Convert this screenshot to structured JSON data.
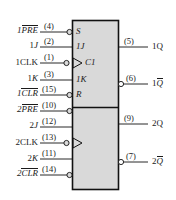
{
  "diagram": {
    "box": {
      "fill": "#d9d9d9",
      "stroke": "#111111",
      "x": 72,
      "y": 20,
      "width": 47,
      "height": 170,
      "divider_y": 107
    },
    "sections": [
      {
        "name": "ff1",
        "inner_labels": [
          "S",
          "1J",
          "C1",
          "1K",
          "R"
        ]
      },
      {
        "name": "ff2",
        "inner_labels": []
      }
    ],
    "inputs": [
      {
        "name": "1PRE",
        "text_plain": "1",
        "text_over": "PRE",
        "pin": "(4)",
        "y": 32,
        "bubble": true,
        "clock": false
      },
      {
        "name": "1J",
        "text_plain": "1",
        "text_over": "",
        "pin": "(2)",
        "y": 47,
        "bubble": false,
        "clock": false,
        "italic_tail": "J"
      },
      {
        "name": "1CLK",
        "text_plain": "1CLK",
        "text_over": "",
        "pin": "(1)",
        "y": 63,
        "bubble": true,
        "clock": true
      },
      {
        "name": "1K",
        "text_plain": "1",
        "text_over": "",
        "pin": "(3)",
        "y": 80,
        "bubble": false,
        "clock": false,
        "italic_tail": "K"
      },
      {
        "name": "1CLR",
        "text_plain": "1",
        "text_over": "CLR",
        "pin": "(15)",
        "y": 95,
        "bubble": true,
        "clock": false
      },
      {
        "name": "2PRE",
        "text_plain": "2",
        "text_over": "PRE",
        "pin": "(10)",
        "y": 111,
        "bubble": true,
        "clock": false
      },
      {
        "name": "2J",
        "text_plain": "2",
        "text_over": "",
        "pin": "(12)",
        "y": 127,
        "bubble": false,
        "clock": false,
        "italic_tail": "J"
      },
      {
        "name": "2CLK",
        "text_plain": "2CLK",
        "text_over": "",
        "pin": "(13)",
        "y": 143,
        "bubble": true,
        "clock": true
      },
      {
        "name": "2K",
        "text_plain": "2",
        "text_over": "",
        "pin": "(11)",
        "y": 159,
        "bubble": false,
        "clock": false,
        "italic_tail": "K"
      },
      {
        "name": "2CLR",
        "text_plain": "2",
        "text_over": "CLR",
        "pin": "(14)",
        "y": 175,
        "bubble": true,
        "clock": false
      }
    ],
    "outputs": [
      {
        "name": "1Q",
        "text_plain": "1Q",
        "text_over": "",
        "pin": "(5)",
        "y": 47,
        "bubble": false
      },
      {
        "name": "1Qnot",
        "text_plain": "1",
        "text_over": "Q",
        "pin": "(6)",
        "y": 84,
        "bubble": true
      },
      {
        "name": "2Q",
        "text_plain": "2Q",
        "text_over": "",
        "pin": "(9)",
        "y": 124,
        "bubble": false
      },
      {
        "name": "2Qnot",
        "text_plain": "2",
        "text_over": "Q",
        "pin": "(7)",
        "y": 162,
        "bubble": true
      }
    ],
    "inner_text": {
      "s": "S",
      "j1": "1J",
      "c1": "C1",
      "k1": "1K",
      "r": "R"
    },
    "labels": {
      "in_1pre_prefix": "1",
      "in_1pre_bar": "PRE",
      "in_1j_prefix": "1",
      "in_1j_italic": "J",
      "in_1clk": "1CLK",
      "in_1k_prefix": "1",
      "in_1k_italic": "K",
      "in_1clr_prefix": "1",
      "in_1clr_bar": "CLR",
      "in_2pre_prefix": "2",
      "in_2pre_bar": "PRE",
      "in_2j_prefix": "2",
      "in_2j_italic": "J",
      "in_2clk": "2CLK",
      "in_2k_prefix": "2",
      "in_2k_italic": "K",
      "in_2clr_prefix": "2",
      "in_2clr_bar": "CLR",
      "pin4": "(4)",
      "pin2": "(2)",
      "pin1": "(1)",
      "pin3": "(3)",
      "pin15": "(15)",
      "pin10": "(10)",
      "pin12": "(12)",
      "pin13": "(13)",
      "pin11": "(11)",
      "pin14": "(14)",
      "pin5": "(5)",
      "pin6": "(6)",
      "pin9": "(9)",
      "pin7": "(7)",
      "out_1q": "1Q",
      "out_1qn_prefix": "1",
      "out_1qn_bar": "Q",
      "out_2q": "2Q",
      "out_2qn_prefix": "2",
      "out_2qn_bar": "Q"
    },
    "colors": {
      "body_fill": "#d9d9d9",
      "line": "#111111",
      "text": "#1a1a1a",
      "page": "#ffffff"
    }
  }
}
